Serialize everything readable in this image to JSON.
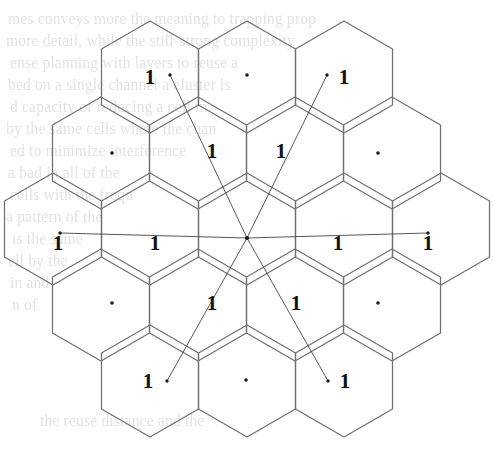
{
  "figure": {
    "background_color": "#ffffff",
    "hex_stroke_color": "#70706e",
    "ray_stroke_color": "#3a3a38",
    "dot_color": "#1a1a1a",
    "label_color": "#111111",
    "ghost_text_color": "#cfcbc6",
    "width": 493,
    "height": 453
  },
  "geometry": {
    "center_x": 247,
    "center_y": 238,
    "hex_radius": 56,
    "hex_half_width": 48.5,
    "rows": 5,
    "total_cells": 19
  },
  "chart_data": {
    "type": "diagram",
    "cluster_size": 19,
    "reuse_label": "1",
    "center_point": {
      "x": 247,
      "y": 238
    },
    "cells": [
      {
        "id": "r1c1",
        "cx": 150,
        "cy": 77,
        "row": 1,
        "col": 1,
        "marker": "label",
        "label": "1"
      },
      {
        "id": "r1c2",
        "cx": 247,
        "cy": 77,
        "row": 1,
        "col": 2,
        "marker": "dot",
        "label": ""
      },
      {
        "id": "r1c3",
        "cx": 344,
        "cy": 77,
        "row": 1,
        "col": 3,
        "marker": "label",
        "label": "1"
      },
      {
        "id": "r2c1",
        "cx": 112,
        "cy": 153,
        "row": 2,
        "col": 1,
        "marker": "dot",
        "label": ""
      },
      {
        "id": "r2c2",
        "cx": 209,
        "cy": 153,
        "row": 2,
        "col": 2,
        "marker": "label",
        "label": "1"
      },
      {
        "id": "r2c3",
        "cx": 285,
        "cy": 153,
        "row": 2,
        "col": 3,
        "marker": "label",
        "label": "1"
      },
      {
        "id": "r2c4",
        "cx": 378,
        "cy": 153,
        "row": 2,
        "col": 4,
        "marker": "dot",
        "label": ""
      },
      {
        "id": "r3c1",
        "cx": 63,
        "cy": 238,
        "row": 3,
        "col": 1,
        "marker": "label",
        "label": "1"
      },
      {
        "id": "r3c2",
        "cx": 160,
        "cy": 238,
        "row": 3,
        "col": 2,
        "marker": "label",
        "label": "1"
      },
      {
        "id": "r3c3",
        "cx": 247,
        "cy": 238,
        "row": 3,
        "col": 3,
        "marker": "center",
        "label": ""
      },
      {
        "id": "r3c4",
        "cx": 334,
        "cy": 238,
        "row": 3,
        "col": 4,
        "marker": "label",
        "label": "1"
      },
      {
        "id": "r3c5",
        "cx": 424,
        "cy": 238,
        "row": 3,
        "col": 5,
        "marker": "label",
        "label": "1"
      },
      {
        "id": "r4c1",
        "cx": 112,
        "cy": 303,
        "row": 4,
        "col": 1,
        "marker": "dot",
        "label": ""
      },
      {
        "id": "r4c2",
        "cx": 210,
        "cy": 303,
        "row": 4,
        "col": 2,
        "marker": "label",
        "label": "1"
      },
      {
        "id": "r4c3",
        "cx": 292,
        "cy": 303,
        "row": 4,
        "col": 3,
        "marker": "label",
        "label": "1"
      },
      {
        "id": "r4c4",
        "cx": 378,
        "cy": 303,
        "row": 4,
        "col": 4,
        "marker": "dot",
        "label": ""
      },
      {
        "id": "r5c1",
        "cx": 150,
        "cy": 380,
        "row": 5,
        "col": 1,
        "marker": "label",
        "label": "1"
      },
      {
        "id": "r5c2",
        "cx": 246,
        "cy": 380,
        "row": 5,
        "col": 2,
        "marker": "dot",
        "label": ""
      },
      {
        "id": "r5c3",
        "cx": 344,
        "cy": 380,
        "row": 5,
        "col": 3,
        "marker": "label",
        "label": "1"
      }
    ],
    "rays": [
      {
        "id": "ray-west",
        "from": [
          247,
          238
        ],
        "to": [
          60,
          233
        ],
        "endpoint_label": "1"
      },
      {
        "id": "ray-east",
        "from": [
          247,
          238
        ],
        "to": [
          428,
          233
        ],
        "endpoint_label": "1"
      },
      {
        "id": "ray-northwest",
        "from": [
          247,
          238
        ],
        "to": [
          170,
          75
        ],
        "endpoint_label": "1"
      },
      {
        "id": "ray-northeast",
        "from": [
          247,
          238
        ],
        "to": [
          327,
          75
        ],
        "endpoint_label": "1"
      },
      {
        "id": "ray-southwest",
        "from": [
          247,
          238
        ],
        "to": [
          167,
          381
        ],
        "endpoint_label": "1"
      },
      {
        "id": "ray-southeast",
        "from": [
          247,
          238
        ],
        "to": [
          328,
          381
        ],
        "endpoint_label": "1"
      }
    ],
    "ray_endpoint_dots": [
      {
        "x": 60,
        "y": 233
      },
      {
        "x": 428,
        "y": 233
      },
      {
        "x": 170,
        "y": 75
      },
      {
        "x": 327,
        "y": 75
      },
      {
        "x": 167,
        "y": 381
      },
      {
        "x": 328,
        "y": 381
      }
    ]
  },
  "labels": [
    {
      "id": "lbl-top-left",
      "text": "1",
      "x": 150,
      "y": 77
    },
    {
      "id": "lbl-top-right",
      "text": "1",
      "x": 344,
      "y": 77
    },
    {
      "id": "lbl-upper-inner-l",
      "text": "1",
      "x": 212,
      "y": 151
    },
    {
      "id": "lbl-upper-inner-r",
      "text": "1",
      "x": 281,
      "y": 151
    },
    {
      "id": "lbl-mid-far-left",
      "text": "1",
      "x": 58,
      "y": 243
    },
    {
      "id": "lbl-mid-left",
      "text": "1",
      "x": 155,
      "y": 243
    },
    {
      "id": "lbl-mid-right",
      "text": "1",
      "x": 338,
      "y": 243
    },
    {
      "id": "lbl-mid-far-right",
      "text": "1",
      "x": 428,
      "y": 243
    },
    {
      "id": "lbl-lower-inner-l",
      "text": "1",
      "x": 212,
      "y": 303
    },
    {
      "id": "lbl-lower-inner-r",
      "text": "1",
      "x": 296,
      "y": 303
    },
    {
      "id": "lbl-bottom-left",
      "text": "1",
      "x": 148,
      "y": 381
    },
    {
      "id": "lbl-bottom-right",
      "text": "1",
      "x": 345,
      "y": 381
    }
  ],
  "dots": [
    {
      "id": "dot-top-center",
      "x": 247,
      "y": 75
    },
    {
      "id": "dot-row2-left",
      "x": 112,
      "y": 153
    },
    {
      "id": "dot-row2-right",
      "x": 378,
      "y": 153
    },
    {
      "id": "dot-center",
      "x": 247,
      "y": 238
    },
    {
      "id": "dot-row4-left",
      "x": 112,
      "y": 303
    },
    {
      "id": "dot-row4-right",
      "x": 378,
      "y": 303
    },
    {
      "id": "dot-bottom-center",
      "x": 246,
      "y": 380
    }
  ],
  "ghost_text": {
    "description": "Faint show-through text from the reverse side of the scanned page",
    "lines": [
      {
        "text": "mes conveys more the meaning to trapping prop",
        "x": 8,
        "y": 10
      },
      {
        "text": "more detail, while the still-strong complexity",
        "x": 6,
        "y": 32
      },
      {
        "text": "ense  planning   with  layers  to  reuse  a",
        "x": 10,
        "y": 54
      },
      {
        "text": "bed  on  a  single  channel  a  cluster  is",
        "x": 8,
        "y": 76
      },
      {
        "text": "d  capacity  or  reducing  a  cell  in",
        "x": 10,
        "y": 98
      },
      {
        "text": "by the same cells  where the chan",
        "x": 6,
        "y": 120
      },
      {
        "text": "ed  to  minimize  interference",
        "x": 10,
        "y": 142
      },
      {
        "text": "a  bad  in  all  of  the",
        "x": 8,
        "y": 164
      },
      {
        "text": "cells  with  the  frequ",
        "x": 10,
        "y": 186
      },
      {
        "text": "a  pattern  of  the",
        "x": 6,
        "y": 208
      },
      {
        "text": "is  the  same",
        "x": 12,
        "y": 230
      },
      {
        "text": "ell  by  the",
        "x": 8,
        "y": 252
      },
      {
        "text": "in  and",
        "x": 10,
        "y": 274
      },
      {
        "text": "n  of",
        "x": 12,
        "y": 296
      },
      {
        "text": "the  reuse  distance  and  the",
        "x": 40,
        "y": 412
      }
    ]
  }
}
